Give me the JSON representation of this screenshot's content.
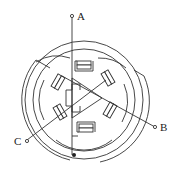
{
  "diagram": {
    "type": "three-phase stepper motor winding schematic",
    "terminals": [
      {
        "id": "A",
        "label": "A",
        "position": "top"
      },
      {
        "id": "B",
        "label": "B",
        "position": "lower-right"
      },
      {
        "id": "C",
        "label": "C",
        "position": "lower-left"
      }
    ],
    "stator_poles": 6,
    "rotor": "triangular toothed rotor at center",
    "common_point": "star junction (filled dot) at bottom",
    "colors": {
      "line": "#333333",
      "background": "#ffffff"
    }
  }
}
